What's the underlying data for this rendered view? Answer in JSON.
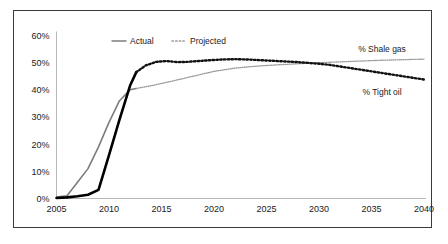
{
  "chart_data": {
    "type": "line",
    "title": "",
    "subtitle": "",
    "xlabel": "",
    "ylabel": "",
    "xlim": [
      2005,
      2040
    ],
    "ylim": [
      0,
      60
    ],
    "grid": false,
    "legend_position": "top-center",
    "x_tick_labels": [
      "2005",
      "2010",
      "2015",
      "2020",
      "2025",
      "2030",
      "2035",
      "2040"
    ],
    "x_ticks": [
      2005,
      2010,
      2015,
      2020,
      2025,
      2030,
      2035,
      2040
    ],
    "y_tick_labels": [
      "0%",
      "10%",
      "20%",
      "30%",
      "40%",
      "50%",
      "60%"
    ],
    "y_ticks": [
      0,
      10,
      20,
      30,
      40,
      50,
      60
    ],
    "legend": [
      {
        "label": "Actual",
        "style": "solid"
      },
      {
        "label": "Projected",
        "style": "dotted"
      }
    ],
    "annotations": [
      {
        "text": "% Shale gas",
        "x": 2036,
        "y": 54
      },
      {
        "text": "% Tight oil",
        "x": 2036,
        "y": 38
      }
    ],
    "series": [
      {
        "name": "% Shale gas",
        "phase": "actual",
        "style": "solid",
        "color": "#7d7d7d",
        "width": 1.6,
        "x": [
          2005,
          2006,
          2007,
          2008,
          2009,
          2010,
          2011,
          2012,
          2012.6
        ],
        "values": [
          0.5,
          1.0,
          6.0,
          11.0,
          19.0,
          28.0,
          36.0,
          40.0,
          40.5
        ]
      },
      {
        "name": "% Tight oil",
        "phase": "actual",
        "style": "solid",
        "color": "#000000",
        "width": 2.6,
        "x": [
          2005,
          2006,
          2007,
          2008,
          2009,
          2010,
          2011,
          2012,
          2012.6
        ],
        "values": [
          0.2,
          0.4,
          0.8,
          1.4,
          3.2,
          16.0,
          29.0,
          41.5,
          46.5
        ]
      },
      {
        "name": "% Shale gas",
        "phase": "projected",
        "style": "dotted",
        "color": "#9a9a9a",
        "width": 1.3,
        "x": [
          2012.6,
          2014,
          2016,
          2018,
          2020,
          2022,
          2024,
          2026,
          2028,
          2030,
          2032,
          2034,
          2036,
          2038,
          2040
        ],
        "values": [
          40.5,
          41.5,
          43.2,
          45.0,
          46.8,
          48.0,
          48.7,
          49.2,
          49.6,
          50.0,
          50.3,
          50.6,
          50.9,
          51.1,
          51.3
        ]
      },
      {
        "name": "% Tight oil",
        "phase": "projected",
        "style": "dotted",
        "color": "#111111",
        "width": 2.4,
        "x": [
          2012.6,
          2013.5,
          2014.5,
          2015.5,
          2016.5,
          2017.5,
          2018.5,
          2020,
          2021,
          2022,
          2023,
          2024,
          2026,
          2028,
          2030,
          2031,
          2032,
          2034,
          2036,
          2038,
          2040
        ],
        "values": [
          46.5,
          49.0,
          50.3,
          50.6,
          50.2,
          50.3,
          50.6,
          51.0,
          51.2,
          51.3,
          51.2,
          51.0,
          50.6,
          50.2,
          49.6,
          49.2,
          48.6,
          47.4,
          46.2,
          45.0,
          43.8
        ]
      }
    ]
  },
  "colors": {
    "frame": "#3a3a3a",
    "axis": "#b8b8b8",
    "text": "#1a1a1a",
    "actual_shale": "#7d7d7d",
    "actual_tight": "#000000",
    "projected_shale": "#9a9a9a",
    "projected_tight": "#111111",
    "background": "#ffffff"
  }
}
